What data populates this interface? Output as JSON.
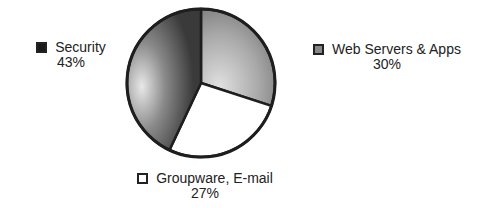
{
  "chart_data": {
    "type": "pie",
    "title": "",
    "slices": [
      {
        "label": "Web Servers & Apps",
        "value": 30,
        "display": "30%",
        "color": "#9a9a9a"
      },
      {
        "label": "Groupware, E-mail",
        "value": 27,
        "display": "27%",
        "color": "#ffffff"
      },
      {
        "label": "Security",
        "value": 43,
        "display": "43%",
        "color": "#555555"
      }
    ],
    "categories": [
      "Web Servers & Apps",
      "Groupware, E-mail",
      "Security"
    ],
    "values": [
      30,
      27,
      43
    ],
    "legend_position": "around pie (labels adjacent to slices)"
  },
  "legend": {
    "security": {
      "label": "Security",
      "pct": "43%",
      "swatch": "#1a1a1a"
    },
    "web": {
      "label": "Web Servers & Apps",
      "pct": "30%",
      "swatch": "#888888"
    },
    "group": {
      "label": "Groupware, E-mail",
      "pct": "27%",
      "swatch": "#ffffff"
    }
  }
}
